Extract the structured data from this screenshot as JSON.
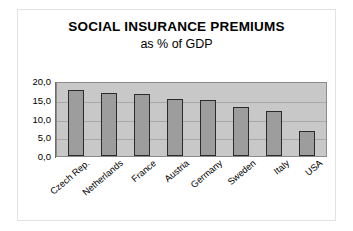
{
  "chart_data": {
    "type": "bar",
    "title": "SOCIAL INSURANCE PREMIUMS",
    "subtitle": "as % of GDP",
    "xlabel": "",
    "ylabel": "",
    "categories": [
      "Czech Rep.",
      "Netherlands",
      "France",
      "Austria",
      "Germany",
      "Sweden",
      "Italy",
      "USA"
    ],
    "values": [
      17.7,
      16.8,
      16.6,
      15.1,
      14.8,
      13.0,
      12.1,
      6.7
    ],
    "ytick_labels": [
      "20,0",
      "15,0",
      "10,0",
      "5,0",
      "0,0"
    ],
    "ytick_values": [
      20.0,
      15.0,
      10.0,
      5.0,
      0.0
    ],
    "ylim": [
      0,
      20
    ],
    "grid": true,
    "legend": false,
    "colors": {
      "bar_fill": "#9d9d9d",
      "bar_border": "#2b2b2b",
      "plot_background": "#c8c8c8",
      "gridline": "#a8a8a8",
      "axis": "#6e6e6e",
      "text": "#000000",
      "frame": "#e2e2e2",
      "page_background": "#ffffff"
    }
  }
}
